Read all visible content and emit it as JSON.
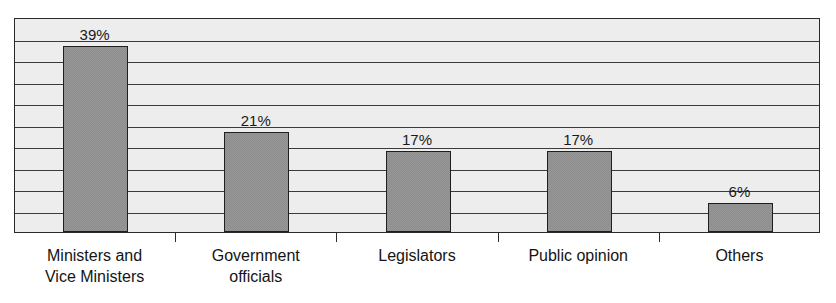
{
  "chart_data": {
    "type": "bar",
    "title": "",
    "subtitle": "",
    "xlabel": "",
    "ylabel": "",
    "categories": [
      "Ministers and\nVice Ministers",
      "Government\nofficials",
      "Legislators",
      "Public opinion",
      "Others"
    ],
    "values": [
      39,
      21,
      17,
      17,
      6
    ],
    "data_labels": [
      "39%",
      "21%",
      "17%",
      "17%",
      "6%"
    ],
    "unit": "%",
    "ylim": [
      0,
      45
    ],
    "grid": true,
    "gridline_count": 9,
    "legend": "none",
    "legend_position": "none",
    "axis_tick_labels_y": [],
    "colors": {
      "bar_fill": "#8c8c8c",
      "bar_border": "#1f1f1f",
      "plot_background": "#ededed",
      "gridline": "#3a3a3a",
      "axis": "#2b2b2b",
      "text": "#141414",
      "page_background": "#ffffff"
    }
  }
}
